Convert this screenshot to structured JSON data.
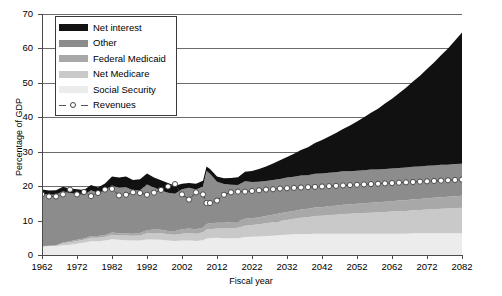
{
  "chart_data": {
    "type": "area",
    "title": "",
    "xlabel": "Fiscal year",
    "ylabel": "Percentage of GDP",
    "xlim": [
      1962,
      2082
    ],
    "ylim": [
      0,
      70
    ],
    "xticks": [
      1962,
      1972,
      1982,
      1992,
      2002,
      2012,
      2022,
      2032,
      2042,
      2052,
      2062,
      2072,
      2082
    ],
    "yticks": [
      0,
      10,
      20,
      30,
      40,
      50,
      60,
      70
    ],
    "grid": "horizontal",
    "legend_position": "top-left",
    "stacked": true,
    "stack_order_bottom_to_top": [
      "Social Security",
      "Net Medicare",
      "Federal Medicaid",
      "Other",
      "Net interest"
    ],
    "x": [
      1962,
      1964,
      1966,
      1968,
      1970,
      1972,
      1974,
      1976,
      1978,
      1980,
      1982,
      1984,
      1986,
      1988,
      1990,
      1992,
      1994,
      1996,
      1998,
      2000,
      2002,
      2004,
      2006,
      2008,
      2009,
      2010,
      2012,
      2014,
      2016,
      2018,
      2020,
      2022,
      2024,
      2026,
      2028,
      2030,
      2032,
      2034,
      2036,
      2038,
      2040,
      2042,
      2044,
      2046,
      2048,
      2050,
      2052,
      2054,
      2056,
      2058,
      2060,
      2062,
      2064,
      2066,
      2068,
      2070,
      2072,
      2074,
      2076,
      2078,
      2080,
      2082
    ],
    "series": [
      {
        "name": "Social Security",
        "color": "#ececec",
        "values": [
          2.5,
          2.6,
          2.6,
          2.8,
          3.0,
          3.3,
          3.6,
          4.0,
          4.0,
          4.2,
          4.6,
          4.4,
          4.3,
          4.2,
          4.2,
          4.5,
          4.5,
          4.4,
          4.2,
          4.1,
          4.2,
          4.2,
          4.1,
          4.3,
          4.8,
          4.9,
          5.0,
          4.9,
          4.9,
          4.9,
          5.2,
          5.3,
          5.4,
          5.5,
          5.6,
          5.8,
          5.9,
          6.0,
          6.1,
          6.1,
          6.2,
          6.2,
          6.2,
          6.2,
          6.2,
          6.2,
          6.2,
          6.2,
          6.2,
          6.2,
          6.2,
          6.2,
          6.2,
          6.2,
          6.3,
          6.3,
          6.3,
          6.3,
          6.3,
          6.3,
          6.3,
          6.3
        ]
      },
      {
        "name": "Net Medicare",
        "color": "#c9c9c9",
        "values": [
          0.0,
          0.0,
          0.1,
          0.6,
          0.7,
          0.8,
          0.8,
          1.0,
          1.0,
          1.1,
          1.3,
          1.3,
          1.4,
          1.4,
          1.5,
          1.8,
          1.9,
          1.9,
          1.8,
          1.8,
          2.0,
          2.1,
          2.1,
          2.3,
          2.6,
          2.6,
          2.7,
          2.8,
          2.9,
          3.0,
          3.3,
          3.4,
          3.5,
          3.7,
          3.9,
          4.1,
          4.3,
          4.5,
          4.7,
          4.9,
          5.1,
          5.2,
          5.4,
          5.5,
          5.7,
          5.8,
          5.9,
          6.0,
          6.1,
          6.2,
          6.3,
          6.4,
          6.5,
          6.6,
          6.7,
          6.8,
          6.9,
          7.0,
          7.1,
          7.2,
          7.3,
          7.4
        ]
      },
      {
        "name": "Federal Medicaid",
        "color": "#a8a8a8",
        "values": [
          0.1,
          0.1,
          0.1,
          0.2,
          0.3,
          0.3,
          0.4,
          0.5,
          0.5,
          0.5,
          0.6,
          0.6,
          0.6,
          0.6,
          0.7,
          0.9,
          1.0,
          1.0,
          1.0,
          1.1,
          1.3,
          1.4,
          1.3,
          1.3,
          1.6,
          1.7,
          1.7,
          1.7,
          1.8,
          1.8,
          2.0,
          2.0,
          2.1,
          2.1,
          2.2,
          2.2,
          2.3,
          2.3,
          2.4,
          2.4,
          2.5,
          2.5,
          2.6,
          2.6,
          2.7,
          2.7,
          2.8,
          2.8,
          2.9,
          2.9,
          3.0,
          3.0,
          3.1,
          3.1,
          3.2,
          3.2,
          3.3,
          3.3,
          3.4,
          3.4,
          3.5,
          3.5
        ]
      },
      {
        "name": "Other",
        "color": "#8c8c8c",
        "values": [
          15.2,
          14.8,
          14.8,
          14.9,
          13.9,
          13.4,
          12.6,
          13.3,
          12.5,
          13.1,
          13.7,
          13.2,
          13.4,
          12.6,
          12.4,
          13.3,
          12.2,
          11.4,
          11.1,
          10.8,
          11.6,
          11.8,
          11.5,
          12.0,
          15.4,
          14.4,
          11.9,
          11.2,
          10.8,
          10.6,
          10.9,
          10.5,
          10.3,
          10.2,
          10.1,
          10.0,
          10.0,
          9.9,
          9.9,
          9.8,
          9.8,
          9.8,
          9.7,
          9.7,
          9.7,
          9.6,
          9.6,
          9.6,
          9.6,
          9.5,
          9.5,
          9.5,
          9.5,
          9.5,
          9.4,
          9.4,
          9.4,
          9.4,
          9.4,
          9.3,
          9.3,
          9.3
        ]
      },
      {
        "name": "Net interest",
        "color": "#111111",
        "values": [
          1.2,
          1.2,
          1.2,
          1.3,
          1.4,
          1.3,
          1.5,
          1.5,
          1.6,
          1.9,
          2.6,
          3.0,
          3.1,
          3.0,
          3.2,
          3.2,
          2.9,
          3.0,
          2.8,
          2.3,
          1.6,
          1.4,
          1.7,
          1.7,
          1.3,
          1.4,
          1.5,
          1.7,
          2.0,
          2.3,
          2.8,
          3.2,
          3.7,
          4.2,
          4.8,
          5.4,
          6.0,
          6.7,
          7.4,
          8.1,
          8.9,
          9.7,
          10.5,
          11.4,
          12.3,
          13.3,
          14.3,
          15.4,
          16.5,
          17.7,
          19.0,
          20.3,
          21.7,
          23.2,
          24.8,
          26.4,
          28.1,
          29.9,
          31.8,
          33.8,
          35.9,
          38.1
        ]
      }
    ],
    "revenues": {
      "name": "Revenues",
      "marker": "open-circle",
      "line_style": "dashed",
      "marker_face_color": "#ffffff",
      "marker_edge_color": "#3d3d3d",
      "values": [
        17.6,
        17.0,
        17.0,
        17.6,
        19.0,
        17.6,
        18.3,
        17.1,
        18.0,
        19.0,
        19.2,
        17.3,
        17.5,
        18.2,
        18.0,
        17.5,
        18.1,
        18.9,
        19.9,
        20.6,
        17.6,
        16.1,
        18.2,
        17.6,
        15.1,
        15.1,
        15.8,
        17.5,
        18.2,
        18.4,
        18.4,
        18.6,
        18.8,
        19.0,
        19.1,
        19.3,
        19.4,
        19.5,
        19.6,
        19.7,
        19.8,
        19.9,
        20.0,
        20.1,
        20.2,
        20.3,
        20.4,
        20.5,
        20.6,
        20.7,
        20.8,
        20.9,
        21.0,
        21.1,
        21.2,
        21.3,
        21.4,
        21.5,
        21.6,
        21.7,
        21.8,
        21.9
      ]
    }
  },
  "legend": {
    "items": [
      {
        "label": "Net interest",
        "color": "#111111"
      },
      {
        "label": "Other",
        "color": "#8c8c8c"
      },
      {
        "label": "Federal Medicaid",
        "color": "#a8a8a8"
      },
      {
        "label": "Net Medicare",
        "color": "#c9c9c9"
      },
      {
        "label": "Social Security",
        "color": "#ececec"
      },
      {
        "label": "Revenues",
        "color": "#ffffff"
      }
    ]
  }
}
